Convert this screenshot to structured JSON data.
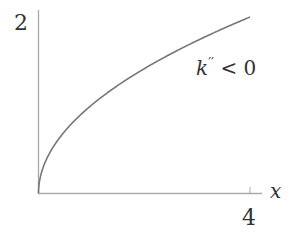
{
  "chart_data": {
    "type": "line",
    "title": "",
    "xlabel": "x",
    "ylabel": "",
    "xlim": [
      0,
      4
    ],
    "ylim": [
      0,
      2
    ],
    "x_ticks": [
      4
    ],
    "y_ticks": [
      2
    ],
    "x_tick_labels": [
      "4"
    ],
    "y_tick_labels": [
      "2"
    ],
    "grid": false,
    "legend": null,
    "series": [
      {
        "name": "k(x) = sqrt(x)",
        "function": "sqrt",
        "x": [
          0,
          0.25,
          0.5,
          1,
          1.5,
          2,
          2.5,
          3,
          3.5,
          4
        ],
        "y": [
          0,
          0.5,
          0.707,
          1,
          1.225,
          1.414,
          1.581,
          1.732,
          1.871,
          2
        ],
        "color": "#777777"
      }
    ],
    "annotations": [
      {
        "text": "k'' < 0",
        "x": 3.8,
        "y": 1.4
      }
    ]
  },
  "labels": {
    "y_tick": "2",
    "x_tick": "4",
    "x_axis": "x",
    "annotation_k": "k",
    "annotation_prime": "′′",
    "annotation_rest": " < 0"
  }
}
